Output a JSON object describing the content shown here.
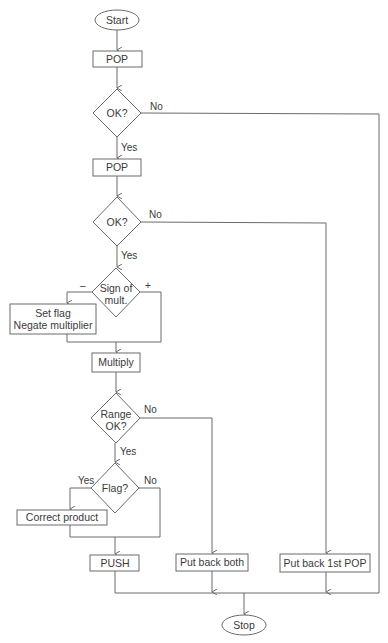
{
  "diagram": {
    "type": "flowchart",
    "nodes": {
      "start": "Start",
      "pop1": "POP",
      "ok1": "OK?",
      "pop2": "POP",
      "ok2": "OK?",
      "sign_line1": "Sign of",
      "sign_line2": "mult.",
      "setflag_line1": "Set flag",
      "setflag_line2": "Negate multiplier",
      "multiply": "Multiply",
      "range_line1": "Range",
      "range_line2": "OK?",
      "flag": "Flag?",
      "correct": "Correct product",
      "push": "PUSH",
      "putback_both": "Put back both",
      "putback_first": "Put back 1st POP",
      "stop": "Stop"
    },
    "edge_labels": {
      "ok1_no": "No",
      "ok1_yes": "Yes",
      "ok2_no": "No",
      "ok2_yes": "Yes",
      "sign_minus": "–",
      "sign_plus": "+",
      "range_no": "No",
      "range_yes": "Yes",
      "flag_yes": "Yes",
      "flag_no": "No"
    },
    "colors": {
      "line": "#6a6a6a",
      "text": "#3a3a3a",
      "background": "#ffffff"
    }
  }
}
